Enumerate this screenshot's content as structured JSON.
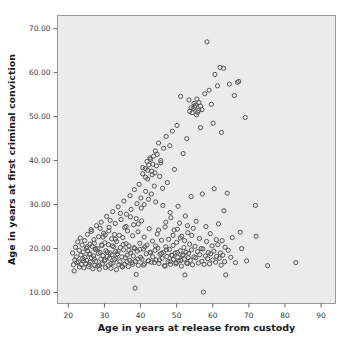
{
  "chart_data": {
    "type": "scatter",
    "title": "",
    "xlabel": "Age in years at release from custody",
    "ylabel": "Age in years at first criminal conviction",
    "xlim": [
      17,
      94
    ],
    "ylim": [
      7.5,
      73
    ],
    "xticks": [
      20,
      30,
      40,
      50,
      60,
      70,
      80,
      90
    ],
    "xtick_labels": [
      "20",
      "30",
      "40",
      "50",
      "60",
      "70",
      "80",
      "90"
    ],
    "yticks": [
      10,
      20,
      30,
      40,
      50,
      60,
      70
    ],
    "ytick_labels": [
      "10.00",
      "20.00",
      "30.00",
      "40.00",
      "50.00",
      "60.00",
      "70.00"
    ],
    "grid": false,
    "legend": null,
    "marker": {
      "shape": "circle-open",
      "size_px": 4.2,
      "stroke": "#555555",
      "fill": "none",
      "stroke_width": 1
    },
    "plot_background": "#ebebeb",
    "frame_color": "#999999",
    "points": [
      [
        21.2,
        19.0
      ],
      [
        21.4,
        16.3
      ],
      [
        21.6,
        14.9
      ],
      [
        21.8,
        17.4
      ],
      [
        22.0,
        20.3
      ],
      [
        22.2,
        18.1
      ],
      [
        22.4,
        16.8
      ],
      [
        22.6,
        21.5
      ],
      [
        22.8,
        17.0
      ],
      [
        23.0,
        19.6
      ],
      [
        23.1,
        15.8
      ],
      [
        23.3,
        22.4
      ],
      [
        23.5,
        18.5
      ],
      [
        23.6,
        16.4
      ],
      [
        23.8,
        20.8
      ],
      [
        24.0,
        17.7
      ],
      [
        24.1,
        19.2
      ],
      [
        24.3,
        15.6
      ],
      [
        24.5,
        21.8
      ],
      [
        24.6,
        18.0
      ],
      [
        24.8,
        16.6
      ],
      [
        25.0,
        20.1
      ],
      [
        25.1,
        17.3
      ],
      [
        25.3,
        23.2
      ],
      [
        25.4,
        19.4
      ],
      [
        25.6,
        15.9
      ],
      [
        25.8,
        18.7
      ],
      [
        26.0,
        21.0
      ],
      [
        26.1,
        16.9
      ],
      [
        26.3,
        24.3
      ],
      [
        26.4,
        17.9
      ],
      [
        26.6,
        20.5
      ],
      [
        26.8,
        15.4
      ],
      [
        27.0,
        18.3
      ],
      [
        27.1,
        22.0
      ],
      [
        27.3,
        16.2
      ],
      [
        27.4,
        19.8
      ],
      [
        27.6,
        17.1
      ],
      [
        27.8,
        25.2
      ],
      [
        28.0,
        20.0
      ],
      [
        28.1,
        16.0
      ],
      [
        28.3,
        18.9
      ],
      [
        28.4,
        22.7
      ],
      [
        28.6,
        15.3
      ],
      [
        28.8,
        19.1
      ],
      [
        29.0,
        17.6
      ],
      [
        29.1,
        26.0
      ],
      [
        29.3,
        20.7
      ],
      [
        29.4,
        16.5
      ],
      [
        29.6,
        18.4
      ],
      [
        29.8,
        23.5
      ],
      [
        30.0,
        17.2
      ],
      [
        30.1,
        21.3
      ],
      [
        30.3,
        15.7
      ],
      [
        30.4,
        19.5
      ],
      [
        30.6,
        27.3
      ],
      [
        30.8,
        18.2
      ],
      [
        31.0,
        16.1
      ],
      [
        31.1,
        20.9
      ],
      [
        31.3,
        24.8
      ],
      [
        31.4,
        17.8
      ],
      [
        31.6,
        19.0
      ],
      [
        31.8,
        15.5
      ],
      [
        32.0,
        22.2
      ],
      [
        32.1,
        18.6
      ],
      [
        32.3,
        28.4
      ],
      [
        32.4,
        16.7
      ],
      [
        32.6,
        20.4
      ],
      [
        32.8,
        17.5
      ],
      [
        33.0,
        25.7
      ],
      [
        33.1,
        19.3
      ],
      [
        33.3,
        15.2
      ],
      [
        33.4,
        21.6
      ],
      [
        33.6,
        18.8
      ],
      [
        33.8,
        29.5
      ],
      [
        34.0,
        16.3
      ],
      [
        34.1,
        23.0
      ],
      [
        34.3,
        17.0
      ],
      [
        34.4,
        20.2
      ],
      [
        34.6,
        26.6
      ],
      [
        34.8,
        18.1
      ],
      [
        35.0,
        15.8
      ],
      [
        35.1,
        22.5
      ],
      [
        35.3,
        19.7
      ],
      [
        35.4,
        30.8
      ],
      [
        35.6,
        16.4
      ],
      [
        35.8,
        17.9
      ],
      [
        36.0,
        21.1
      ],
      [
        36.1,
        27.8
      ],
      [
        36.3,
        18.5
      ],
      [
        36.4,
        24.0
      ],
      [
        36.6,
        15.9
      ],
      [
        36.8,
        20.6
      ],
      [
        37.0,
        17.3
      ],
      [
        37.1,
        32.0
      ],
      [
        37.3,
        19.0
      ],
      [
        37.4,
        28.9
      ],
      [
        37.6,
        16.8
      ],
      [
        37.8,
        22.9
      ],
      [
        38.0,
        18.3
      ],
      [
        38.1,
        25.4
      ],
      [
        38.3,
        33.4
      ],
      [
        38.4,
        20.0
      ],
      [
        38.6,
        17.1
      ],
      [
        38.8,
        14.1
      ],
      [
        38.5,
        11.0
      ],
      [
        39.0,
        30.2
      ],
      [
        39.1,
        19.4
      ],
      [
        39.3,
        23.8
      ],
      [
        39.4,
        16.2
      ],
      [
        39.6,
        34.6
      ],
      [
        39.8,
        21.2
      ],
      [
        40.0,
        18.0
      ],
      [
        40.1,
        31.5
      ],
      [
        40.3,
        26.3
      ],
      [
        40.4,
        17.6
      ],
      [
        40.6,
        37.0
      ],
      [
        40.8,
        19.9
      ],
      [
        41.0,
        22.6
      ],
      [
        41.1,
        16.5
      ],
      [
        41.3,
        38.2
      ],
      [
        41.4,
        33.0
      ],
      [
        41.6,
        18.8
      ],
      [
        41.8,
        20.8
      ],
      [
        42.0,
        35.8
      ],
      [
        42.1,
        17.2
      ],
      [
        42.3,
        39.0
      ],
      [
        42.4,
        24.5
      ],
      [
        42.6,
        19.2
      ],
      [
        42.8,
        40.3
      ],
      [
        43.0,
        16.9
      ],
      [
        43.1,
        37.6
      ],
      [
        43.3,
        21.7
      ],
      [
        43.4,
        18.1
      ],
      [
        43.6,
        41.0
      ],
      [
        43.8,
        34.2
      ],
      [
        44.0,
        19.6
      ],
      [
        44.1,
        42.2
      ],
      [
        44.3,
        17.4
      ],
      [
        44.4,
        38.8
      ],
      [
        44.6,
        23.3
      ],
      [
        44.8,
        20.1
      ],
      [
        45.0,
        44.0
      ],
      [
        45.1,
        16.6
      ],
      [
        45.3,
        36.4
      ],
      [
        45.4,
        18.7
      ],
      [
        45.6,
        39.5
      ],
      [
        45.8,
        21.9
      ],
      [
        46.0,
        17.8
      ],
      [
        46.1,
        33.7
      ],
      [
        46.3,
        19.1
      ],
      [
        46.4,
        42.8
      ],
      [
        46.6,
        16.1
      ],
      [
        46.8,
        24.9
      ],
      [
        47.0,
        20.4
      ],
      [
        47.1,
        45.5
      ],
      [
        47.3,
        18.2
      ],
      [
        47.4,
        35.0
      ],
      [
        47.6,
        17.0
      ],
      [
        47.8,
        22.1
      ],
      [
        48.0,
        19.8
      ],
      [
        48.1,
        43.4
      ],
      [
        48.3,
        16.4
      ],
      [
        48.4,
        27.0
      ],
      [
        48.6,
        18.5
      ],
      [
        48.8,
        46.7
      ],
      [
        49.0,
        20.7
      ],
      [
        49.1,
        17.5
      ],
      [
        49.3,
        24.2
      ],
      [
        49.4,
        38.0
      ],
      [
        49.6,
        19.0
      ],
      [
        49.8,
        16.8
      ],
      [
        50.0,
        21.4
      ],
      [
        50.1,
        48.0
      ],
      [
        50.3,
        18.0
      ],
      [
        50.4,
        29.6
      ],
      [
        50.6,
        17.2
      ],
      [
        50.8,
        25.8
      ],
      [
        51.0,
        19.5
      ],
      [
        51.1,
        54.6
      ],
      [
        51.3,
        16.0
      ],
      [
        51.4,
        22.8
      ],
      [
        51.6,
        18.4
      ],
      [
        51.8,
        41.6
      ],
      [
        52.0,
        20.2
      ],
      [
        52.1,
        17.6
      ],
      [
        52.3,
        14.0
      ],
      [
        52.4,
        27.4
      ],
      [
        52.6,
        19.2
      ],
      [
        52.8,
        45.0
      ],
      [
        53.0,
        16.6
      ],
      [
        53.1,
        23.6
      ],
      [
        53.3,
        18.9
      ],
      [
        53.4,
        53.8
      ],
      [
        53.6,
        21.0
      ],
      [
        53.8,
        17.3
      ],
      [
        54.0,
        31.8
      ],
      [
        54.1,
        19.7
      ],
      [
        54.3,
        50.9
      ],
      [
        54.4,
        16.3
      ],
      [
        54.6,
        24.6
      ],
      [
        54.8,
        18.1
      ],
      [
        55.0,
        52.2
      ],
      [
        55.1,
        20.5
      ],
      [
        55.3,
        17.9
      ],
      [
        55.4,
        26.2
      ],
      [
        55.6,
        54.0
      ],
      [
        55.8,
        19.3
      ],
      [
        56.0,
        16.7
      ],
      [
        56.1,
        51.4
      ],
      [
        56.3,
        22.3
      ],
      [
        56.4,
        18.6
      ],
      [
        56.6,
        47.5
      ],
      [
        56.8,
        20.0
      ],
      [
        57.0,
        17.1
      ],
      [
        57.1,
        32.4
      ],
      [
        57.3,
        19.9
      ],
      [
        57.4,
        10.1
      ],
      [
        57.6,
        16.4
      ],
      [
        57.8,
        55.2
      ],
      [
        58.0,
        18.3
      ],
      [
        58.1,
        25.0
      ],
      [
        58.3,
        21.6
      ],
      [
        58.4,
        67.0
      ],
      [
        58.6,
        17.7
      ],
      [
        58.8,
        19.1
      ],
      [
        59.0,
        56.0
      ],
      [
        59.1,
        16.5
      ],
      [
        59.3,
        23.4
      ],
      [
        59.4,
        18.8
      ],
      [
        59.6,
        52.8
      ],
      [
        59.8,
        20.6
      ],
      [
        60.0,
        17.4
      ],
      [
        60.1,
        48.5
      ],
      [
        60.3,
        19.4
      ],
      [
        60.4,
        33.6
      ],
      [
        60.6,
        59.6
      ],
      [
        60.8,
        16.9
      ],
      [
        61.0,
        22.0
      ],
      [
        61.1,
        18.2
      ],
      [
        61.3,
        57.0
      ],
      [
        61.4,
        20.9
      ],
      [
        61.6,
        25.6
      ],
      [
        61.8,
        17.8
      ],
      [
        62.0,
        61.2
      ],
      [
        62.1,
        19.0
      ],
      [
        62.3,
        16.2
      ],
      [
        62.4,
        46.4
      ],
      [
        62.6,
        21.8
      ],
      [
        62.8,
        18.5
      ],
      [
        63.0,
        61.0
      ],
      [
        63.1,
        28.6
      ],
      [
        63.3,
        17.0
      ],
      [
        63.4,
        20.3
      ],
      [
        63.6,
        14.0
      ],
      [
        64.0,
        32.6
      ],
      [
        64.3,
        19.6
      ],
      [
        64.6,
        57.4
      ],
      [
        65.0,
        18.0
      ],
      [
        65.4,
        22.5
      ],
      [
        66.0,
        54.8
      ],
      [
        66.3,
        16.8
      ],
      [
        66.8,
        57.8
      ],
      [
        67.2,
        58.0
      ],
      [
        67.6,
        23.7
      ],
      [
        68.0,
        20.0
      ],
      [
        69.0,
        49.8
      ],
      [
        69.4,
        17.2
      ],
      [
        71.8,
        29.8
      ],
      [
        72.0,
        22.8
      ],
      [
        75.2,
        16.1
      ],
      [
        83.0,
        16.8
      ],
      [
        26.4,
        23.9
      ],
      [
        27.2,
        21.2
      ],
      [
        28.8,
        24.6
      ],
      [
        30.2,
        23.1
      ],
      [
        31.6,
        26.4
      ],
      [
        33.0,
        22.1
      ],
      [
        34.4,
        28.0
      ],
      [
        36.0,
        25.0
      ],
      [
        37.2,
        27.2
      ],
      [
        38.8,
        26.8
      ],
      [
        40.2,
        29.2
      ],
      [
        41.0,
        30.0
      ],
      [
        42.2,
        31.2
      ],
      [
        43.0,
        32.4
      ],
      [
        44.2,
        30.6
      ],
      [
        45.0,
        24.2
      ],
      [
        46.2,
        29.8
      ],
      [
        47.0,
        26.0
      ],
      [
        48.2,
        28.2
      ],
      [
        49.0,
        23.0
      ],
      [
        50.2,
        24.4
      ],
      [
        51.0,
        22.4
      ],
      [
        52.2,
        21.8
      ],
      [
        53.0,
        25.2
      ],
      [
        54.2,
        23.0
      ],
      [
        25.2,
        20.4
      ],
      [
        26.0,
        18.8
      ],
      [
        27.6,
        19.9
      ],
      [
        29.2,
        20.8
      ],
      [
        30.8,
        19.2
      ],
      [
        32.2,
        20.6
      ],
      [
        33.8,
        19.4
      ],
      [
        35.2,
        20.9
      ],
      [
        36.8,
        19.6
      ],
      [
        38.2,
        20.2
      ],
      [
        39.8,
        19.8
      ],
      [
        41.2,
        20.4
      ],
      [
        42.8,
        19.0
      ],
      [
        44.2,
        20.6
      ],
      [
        45.8,
        18.9
      ],
      [
        47.2,
        19.7
      ],
      [
        48.8,
        18.4
      ],
      [
        50.2,
        19.1
      ],
      [
        51.8,
        18.6
      ],
      [
        53.2,
        17.9
      ],
      [
        24.2,
        17.2
      ],
      [
        25.8,
        16.4
      ],
      [
        27.2,
        17.6
      ],
      [
        28.6,
        16.2
      ],
      [
        30.2,
        17.4
      ],
      [
        31.8,
        16.6
      ],
      [
        33.2,
        17.8
      ],
      [
        34.8,
        16.0
      ],
      [
        36.2,
        17.0
      ],
      [
        37.8,
        16.4
      ],
      [
        39.2,
        17.6
      ],
      [
        40.8,
        16.2
      ],
      [
        42.2,
        17.2
      ],
      [
        43.8,
        16.8
      ],
      [
        45.2,
        17.4
      ],
      [
        46.8,
        16.0
      ],
      [
        48.2,
        17.1
      ],
      [
        49.8,
        16.5
      ],
      [
        51.2,
        17.3
      ],
      [
        52.8,
        16.7
      ],
      [
        41.8,
        39.8
      ],
      [
        42.6,
        40.6
      ],
      [
        43.4,
        39.2
      ],
      [
        44.6,
        41.4
      ],
      [
        45.6,
        40.0
      ],
      [
        43.2,
        36.8
      ],
      [
        44.0,
        37.2
      ],
      [
        42.0,
        37.8
      ],
      [
        41.4,
        36.2
      ],
      [
        40.6,
        38.4
      ],
      [
        54.6,
        51.8
      ],
      [
        55.2,
        52.6
      ],
      [
        55.8,
        51.0
      ],
      [
        56.2,
        53.2
      ],
      [
        54.0,
        52.0
      ],
      [
        53.6,
        51.2
      ],
      [
        56.6,
        52.4
      ],
      [
        57.0,
        51.6
      ],
      [
        55.5,
        50.4
      ],
      [
        54.8,
        53.0
      ],
      [
        29.6,
        22.6
      ],
      [
        31.2,
        24.0
      ],
      [
        32.8,
        23.2
      ],
      [
        35.6,
        24.8
      ],
      [
        39.4,
        25.6
      ]
    ],
    "n_points": 330
  }
}
